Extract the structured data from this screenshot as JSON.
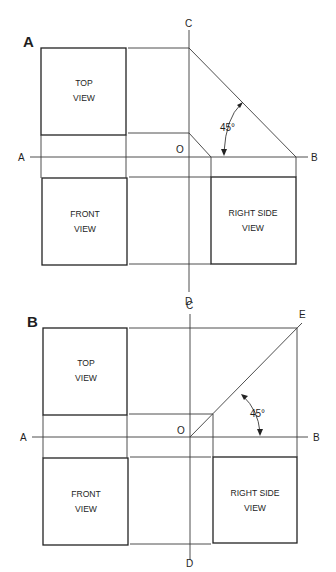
{
  "panels": [
    {
      "id": "A",
      "label": "A",
      "views": {
        "top": [
          "TOP",
          "VIEW"
        ],
        "front": [
          "FRONT",
          "VIEW"
        ],
        "right_side": [
          "RIGHT SIDE",
          "VIEW"
        ]
      },
      "axis_labels": {
        "left": "A",
        "right": "B",
        "top": "C",
        "bottom": "D",
        "origin": "O"
      },
      "angle_label": "45°",
      "miter_direction": "descending from C-line to B-line"
    },
    {
      "id": "B",
      "label": "B",
      "views": {
        "top": [
          "TOP",
          "VIEW"
        ],
        "front": [
          "FRONT",
          "VIEW"
        ],
        "right_side": [
          "RIGHT SIDE",
          "VIEW"
        ]
      },
      "axis_labels": {
        "left": "A",
        "right": "B",
        "top": "C",
        "bottom": "D",
        "origin": "O",
        "miter_end": "E"
      },
      "angle_label": "45°",
      "miter_direction": "ascending from O to E"
    }
  ],
  "colors": {
    "line": "#3a3a3a",
    "box": "#222222",
    "text": "#1e1e1e",
    "background": "#ffffff"
  }
}
